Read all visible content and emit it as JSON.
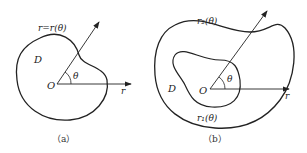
{
  "figure_a": {
    "caption": "（a）",
    "curve_label": "r=r(θ)",
    "region_label": "D",
    "origin_label": "O",
    "angle_label": "θ",
    "axis_label": "r"
  },
  "figure_b": {
    "caption": "（b）",
    "outer_curve_label": "r₂(θ)",
    "inner_curve_label": "r₁(θ)",
    "region_label": "D",
    "origin_label": "O",
    "angle_label": "θ",
    "axis_label": "r"
  },
  "colors": {
    "stroke": "#222222",
    "background": "#ffffff"
  }
}
